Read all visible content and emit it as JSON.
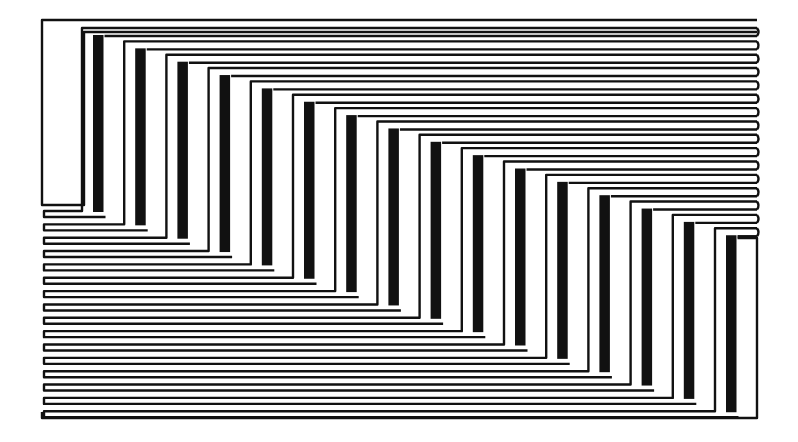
{
  "artwork": {
    "title": "Op-art staircase line pattern",
    "background": "#ffffff",
    "ink": "#111111",
    "canvas": {
      "width": 798,
      "height": 442
    },
    "frame": {
      "left": 42,
      "right": 757,
      "top": 20,
      "bottom": 418
    },
    "steps": 16,
    "step_dx": 42.2,
    "step_dy": 13.35,
    "line_width": 2.4,
    "line_gap": 13.35,
    "first_bar": {
      "x": 93,
      "width": 10.5,
      "top": 35
    },
    "first_outline_x": 82,
    "left_block": {
      "x": 42,
      "top": 20,
      "bottom": 205
    },
    "right_block": {
      "x": 757,
      "top": 238,
      "bottom": 418
    }
  }
}
